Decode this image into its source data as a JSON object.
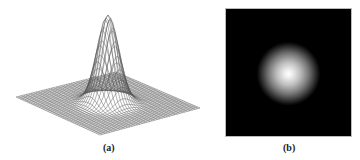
{
  "panels": [
    {
      "id": "a",
      "caption": "(a)",
      "description": "3D wireframe surface plot of 2D Gaussian"
    },
    {
      "id": "b",
      "caption": "(b)",
      "description": "2D Gaussian intensity image on black background"
    }
  ],
  "colors": {
    "mesh": "#555555",
    "background_b": "#000000",
    "peak_b": "#ffffff"
  }
}
